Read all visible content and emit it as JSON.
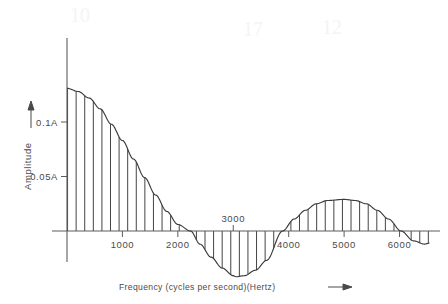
{
  "figure": {
    "background_color": "#ffffff",
    "ink_color": "#3a3a3a",
    "axis_color": "#5c5c5c"
  },
  "axes": {
    "y_axis_title": "Amplitude",
    "y_axis_arrow": "up-arrow",
    "x_axis_title": "Frequency  (cycles per second)(Hertz)",
    "x_axis_arrow": "right-arrow",
    "y_ticks": [
      {
        "label": "0.1A",
        "value": 0.1
      },
      {
        "label": "0.05A",
        "value": 0.05
      }
    ],
    "x_ticks": [
      {
        "label": "1000",
        "value": 1000,
        "position": "below"
      },
      {
        "label": "2000",
        "value": 2000,
        "position": "below"
      },
      {
        "label": "3000",
        "value": 3000,
        "position": "above"
      },
      {
        "label": "4000",
        "value": 4000,
        "position": "below"
      },
      {
        "label": "5000",
        "value": 5000,
        "position": "below"
      },
      {
        "label": "6000",
        "value": 6000,
        "position": "below"
      }
    ]
  },
  "ghost_marks": [
    {
      "text": "10",
      "x": 70,
      "y": 22
    },
    {
      "text": "17",
      "x": 243,
      "y": 36
    },
    {
      "text": "12",
      "x": 322,
      "y": 34
    }
  ],
  "chart_data": {
    "type": "line",
    "title": "",
    "subtitle": "",
    "xlabel": "Frequency  (cycles per second)(Hertz)",
    "ylabel": "Amplitude",
    "xlim": [
      0,
      6550
    ],
    "ylim": [
      -0.055,
      0.145
    ],
    "grid": false,
    "legend": null,
    "shading": "vertical-hatch-lines-to-zero-axis",
    "hatch_spacing_hz": 155,
    "zero_crossings": [
      2230,
      3890,
      6030
    ],
    "lobes": [
      {
        "name": "main-lobe",
        "peak_x": 0,
        "peak_y": 0.131,
        "sign": "positive"
      },
      {
        "name": "first-negative-lobe",
        "peak_x": 3050,
        "peak_y": -0.042,
        "sign": "negative"
      },
      {
        "name": "second-positive-lobe",
        "peak_x": 5000,
        "peak_y": 0.029,
        "sign": "positive"
      },
      {
        "name": "tail-negative-lobe",
        "peak_x": 6450,
        "peak_y": -0.012,
        "sign": "negative"
      }
    ],
    "x": [
      0,
      200,
      400,
      600,
      800,
      1000,
      1200,
      1400,
      1600,
      1800,
      2000,
      2230,
      2400,
      2600,
      2800,
      3000,
      3050,
      3200,
      3400,
      3600,
      3890,
      4100,
      4300,
      4500,
      4700,
      5000,
      5200,
      5400,
      5600,
      5800,
      6030,
      6250,
      6450,
      6550
    ],
    "y": [
      0.131,
      0.128,
      0.122,
      0.112,
      0.098,
      0.083,
      0.066,
      0.049,
      0.033,
      0.018,
      0.006,
      0.0,
      -0.012,
      -0.024,
      -0.034,
      -0.041,
      -0.042,
      -0.041,
      -0.036,
      -0.027,
      0.0,
      0.011,
      0.019,
      0.025,
      0.028,
      0.029,
      0.028,
      0.025,
      0.019,
      0.011,
      0.0,
      -0.009,
      -0.012,
      -0.011
    ]
  }
}
